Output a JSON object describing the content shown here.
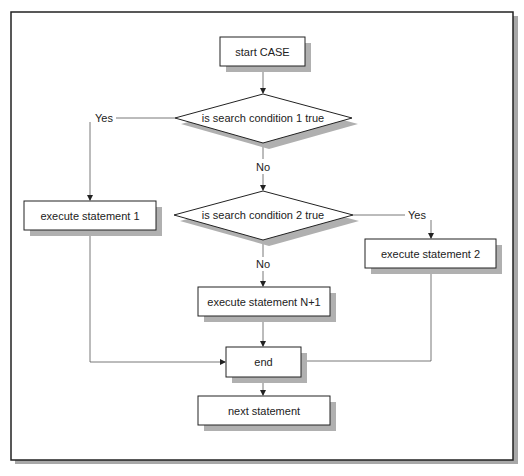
{
  "diagram": {
    "nodes": {
      "start": {
        "type": "process",
        "label": "start CASE"
      },
      "cond1": {
        "type": "decision",
        "label": "is search condition 1 true"
      },
      "cond2": {
        "type": "decision",
        "label": "is search condition 2 true"
      },
      "exec1": {
        "type": "process",
        "label": "execute statement 1"
      },
      "exec2": {
        "type": "process",
        "label": "execute statement 2"
      },
      "execN": {
        "type": "process",
        "label": "execute statement N+1"
      },
      "end": {
        "type": "process",
        "label": "end"
      },
      "next": {
        "type": "process",
        "label": "next statement"
      }
    },
    "edges": [
      {
        "from": "start",
        "to": "cond1",
        "label": ""
      },
      {
        "from": "cond1",
        "to": "exec1",
        "label": "Yes"
      },
      {
        "from": "cond1",
        "to": "cond2",
        "label": "No"
      },
      {
        "from": "cond2",
        "to": "exec2",
        "label": "Yes"
      },
      {
        "from": "cond2",
        "to": "execN",
        "label": "No"
      },
      {
        "from": "exec1",
        "to": "end",
        "label": ""
      },
      {
        "from": "exec2",
        "to": "end",
        "label": ""
      },
      {
        "from": "execN",
        "to": "end",
        "label": ""
      },
      {
        "from": "end",
        "to": "next",
        "label": ""
      }
    ],
    "edge_labels": {
      "cond1_yes": "Yes",
      "cond1_no": "No",
      "cond2_yes": "Yes",
      "cond2_no": "No"
    }
  }
}
